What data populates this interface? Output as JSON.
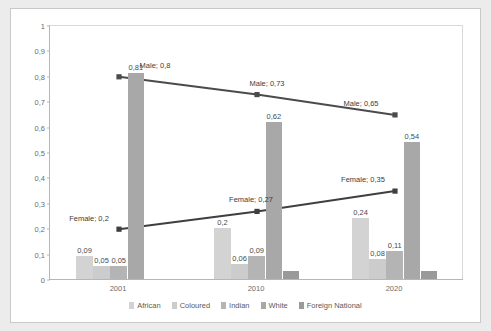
{
  "chart_data": {
    "type": "bar",
    "title": "",
    "subtitle": "",
    "xlabel": "",
    "ylabel": "",
    "categories": [
      "2001",
      "2010",
      "2020"
    ],
    "ylim": [
      0,
      1
    ],
    "ytick_labels": [
      "0",
      "0,1",
      "0,2",
      "0,3",
      "0,4",
      "0,5",
      "0,6",
      "0,7",
      "0,8",
      "0,9",
      "1"
    ],
    "ytick_values": [
      0,
      0.1,
      0.2,
      0.3,
      0.4,
      0.5,
      0.6,
      0.7,
      0.8,
      0.9,
      1
    ],
    "grid": false,
    "legend_position": "bottom",
    "decimal_separator": ",",
    "series": [
      {
        "name": "African",
        "kind": "bar",
        "color": "#d3d3d3",
        "values": [
          0.09,
          0.2,
          0.24
        ],
        "labels": [
          "0,09",
          "0,2",
          "0,24"
        ]
      },
      {
        "name": "Coloured",
        "kind": "bar",
        "color": "#cccccc",
        "values": [
          0.05,
          0.06,
          0.08
        ],
        "labels": [
          "0,05",
          "0,06",
          "0,08"
        ]
      },
      {
        "name": "Indian",
        "kind": "bar",
        "color": "#b4b4b4",
        "values": [
          0.05,
          0.09,
          0.11
        ],
        "labels": [
          "0,05",
          "0,09",
          "0,11"
        ]
      },
      {
        "name": "White",
        "kind": "bar",
        "color": "#a8a8a8",
        "values": [
          0.81,
          0.62,
          0.54
        ],
        "labels": [
          "0,81",
          "0,62",
          "0,54"
        ]
      },
      {
        "name": "Foreign National",
        "kind": "bar",
        "color": "#9a9a9a",
        "values": [
          0,
          0.03,
          0.03
        ],
        "labels": [
          "",
          "",
          ""
        ]
      },
      {
        "name": "Male",
        "kind": "line",
        "color": "#4b4b4b",
        "values": [
          0.8,
          0.73,
          0.65
        ],
        "labels": [
          "Male; 0,8",
          "Male; 0,73",
          "Male; 0,65"
        ]
      },
      {
        "name": "Female",
        "kind": "line",
        "color": "#3f3f3f",
        "values": [
          0.2,
          0.27,
          0.35
        ],
        "labels": [
          "Female; 0,2",
          "Female; 0,27",
          "Female; 0,35"
        ]
      }
    ]
  },
  "legend": {
    "items": [
      {
        "label": "African",
        "color": "#d3d3d3"
      },
      {
        "label": "Coloured",
        "color": "#cccccc"
      },
      {
        "label": "Indian",
        "color": "#b4b4b4"
      },
      {
        "label": "White",
        "color": "#a8a8a8"
      },
      {
        "label": "Foreign National",
        "color": "#9a9a9a"
      }
    ]
  },
  "colors": {
    "figure_background": "#ececed",
    "plot_background": "#ffffff",
    "axis": "#b6b6b6",
    "tick_text": "#6b6b6b",
    "data_label": "#4a4a4a",
    "line_male": "#4b4b4b",
    "line_female": "#3f3f3f"
  }
}
